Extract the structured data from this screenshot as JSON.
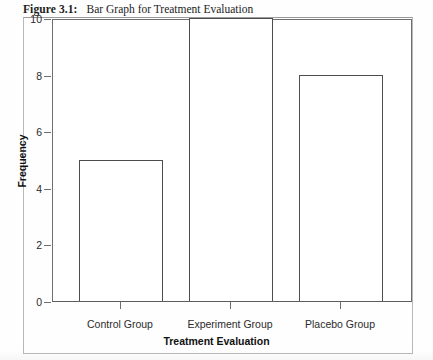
{
  "figure": {
    "label": "Figure 3.1:",
    "title": "Bar Graph for Treatment Evaluation"
  },
  "chart_data": {
    "type": "bar",
    "title": "Bar Graph for Treatment Evaluation",
    "categories": [
      "Control Group",
      "Experiment Group",
      "Placebo Group"
    ],
    "values": [
      5,
      10,
      8
    ],
    "xlabel": "Treatment Evaluation",
    "ylabel": "Frequency",
    "ylim": [
      0,
      10
    ],
    "yticks": [
      0,
      2,
      4,
      6,
      8,
      10
    ],
    "ytick_labels": [
      "0",
      "2",
      "4",
      "6",
      "8",
      "10"
    ],
    "grid": false,
    "legend": false,
    "bar_style": {
      "fill": "#ffffff",
      "edge": "#4d4d4d"
    }
  }
}
